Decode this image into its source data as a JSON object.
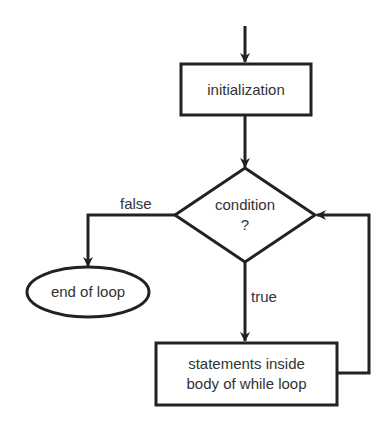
{
  "diagram": {
    "type": "flowchart",
    "title": "",
    "colors": {
      "stroke": "#222222",
      "text": "#333333",
      "background": "#ffffff"
    },
    "nodes": [
      {
        "id": "init",
        "shape": "rectangle",
        "label": "initialization"
      },
      {
        "id": "cond",
        "shape": "diamond",
        "label_line1": "condition",
        "label_line2": "?"
      },
      {
        "id": "body",
        "shape": "rectangle",
        "label_line1": "statements inside",
        "label_line2": "body of while loop"
      },
      {
        "id": "end",
        "shape": "ellipse",
        "label": "end of loop"
      }
    ],
    "edges": [
      {
        "from": "start",
        "to": "init",
        "label": ""
      },
      {
        "from": "init",
        "to": "cond",
        "label": ""
      },
      {
        "from": "cond",
        "to": "end",
        "label": "false"
      },
      {
        "from": "cond",
        "to": "body",
        "label": "true"
      },
      {
        "from": "body",
        "to": "cond",
        "label": ""
      }
    ]
  }
}
